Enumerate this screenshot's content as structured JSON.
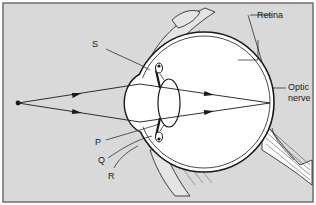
{
  "diagram": {
    "colors": {
      "panel_background": "#d9d9d9",
      "panel_border": "#6d6d6d",
      "eyeball_fill": "#ffffff",
      "line": "#1a1a1a"
    },
    "labels": {
      "S": "S",
      "P": "P",
      "Q": "Q",
      "R": "R",
      "retina": "Retina",
      "optic_nerve_line1": "Optic",
      "optic_nerve_line2": "nerve"
    },
    "elements": [
      {
        "name": "object-point",
        "label": ""
      },
      {
        "name": "ray-upper",
        "label": ""
      },
      {
        "name": "ray-lower",
        "label": ""
      },
      {
        "name": "cornea",
        "label": ""
      },
      {
        "name": "iris",
        "label": ""
      },
      {
        "name": "lens",
        "label": ""
      },
      {
        "name": "ciliary-muscle",
        "label": ""
      },
      {
        "name": "suspensory-ligament",
        "label": ""
      },
      {
        "name": "retina",
        "label": "Retina"
      },
      {
        "name": "optic-nerve",
        "label": "Optic nerve"
      }
    ]
  }
}
